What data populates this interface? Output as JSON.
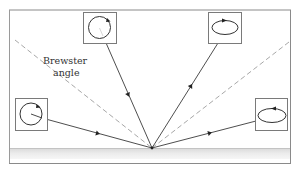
{
  "diagram": {
    "title": "",
    "label": {
      "line1": "Brewster",
      "line2": "angle"
    },
    "colors": {
      "line": "#333333",
      "frame": "#7a7a7a",
      "dashed": "#999999",
      "surface_top": "#e6e6e6",
      "surface_bottom": "#f4f4f4",
      "background": "#ffffff"
    },
    "boxes": [
      {
        "id": "incident-top-left",
        "polarization": "circular",
        "shape": "circle"
      },
      {
        "id": "reflected-top-right",
        "polarization": "elliptical",
        "shape": "ellipse"
      },
      {
        "id": "incident-left",
        "polarization": "circular",
        "shape": "circle"
      },
      {
        "id": "reflected-right",
        "polarization": "elliptical",
        "shape": "ellipse"
      }
    ],
    "rays": [
      {
        "id": "ray-steep-incident",
        "from": "box top-left",
        "to": "surface point"
      },
      {
        "id": "ray-steep-reflected",
        "from": "surface point",
        "to": "box top-right"
      },
      {
        "id": "ray-grazing-incident",
        "from": "box left",
        "to": "surface point"
      },
      {
        "id": "ray-grazing-reflected",
        "from": "surface point",
        "to": "box right"
      }
    ],
    "dashed_lines": [
      {
        "id": "brewster-left"
      },
      {
        "id": "brewster-right"
      }
    ]
  }
}
